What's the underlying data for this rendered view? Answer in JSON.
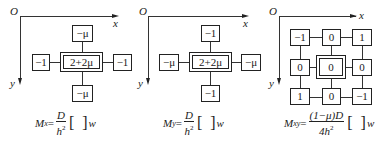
{
  "panels": [
    {
      "id": "Mx",
      "axes": {
        "origin": "O",
        "x": "x",
        "y": "y"
      },
      "stencil": {
        "center": "2+2μ",
        "top": "−μ",
        "bottom": "−μ",
        "left": "−1",
        "right": "−1"
      },
      "formula": {
        "lhs": "M",
        "lhs_sub": "x",
        "eq": "=",
        "num": "D",
        "den": "h",
        "den_sup": "2",
        "rhs": "w"
      }
    },
    {
      "id": "My",
      "axes": {
        "origin": "O",
        "x": "x",
        "y": "y"
      },
      "stencil": {
        "center": "2+2μ",
        "top": "−1",
        "bottom": "−1",
        "left": "−μ",
        "right": "−μ"
      },
      "formula": {
        "lhs": "M",
        "lhs_sub": "y",
        "eq": "=",
        "num": "D",
        "den": "h",
        "den_sup": "2",
        "rhs": "w"
      }
    },
    {
      "id": "Mxy",
      "axes": {
        "origin": "O",
        "x": "x",
        "y": "y"
      },
      "stencil_grid": [
        [
          "−1",
          "0",
          "1"
        ],
        [
          "0",
          "0",
          "0"
        ],
        [
          "1",
          "0",
          "−1"
        ]
      ],
      "formula": {
        "lhs": "M",
        "lhs_sub": "xy",
        "eq": "=",
        "num": "(1−μ)D",
        "den": "4h",
        "den_sup": "2",
        "rhs": "w"
      }
    }
  ]
}
